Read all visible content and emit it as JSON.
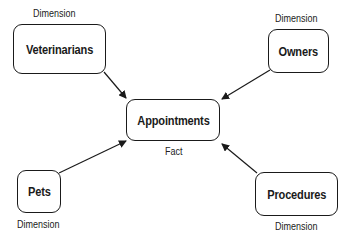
{
  "diagram": {
    "type": "star-schema",
    "fact": {
      "name": "Appointments",
      "role": "Fact"
    },
    "dimensions": [
      {
        "id": "veterinarians",
        "name": "Veterinarians",
        "role": "Dimension"
      },
      {
        "id": "owners",
        "name": "Owners",
        "role": "Dimension"
      },
      {
        "id": "pets",
        "name": "Pets",
        "role": "Dimension"
      },
      {
        "id": "procedures",
        "name": "Procedures",
        "role": "Dimension"
      }
    ],
    "edges": [
      {
        "from": "veterinarians",
        "to": "appointments"
      },
      {
        "from": "owners",
        "to": "appointments"
      },
      {
        "from": "pets",
        "to": "appointments"
      },
      {
        "from": "procedures",
        "to": "appointments"
      }
    ]
  }
}
